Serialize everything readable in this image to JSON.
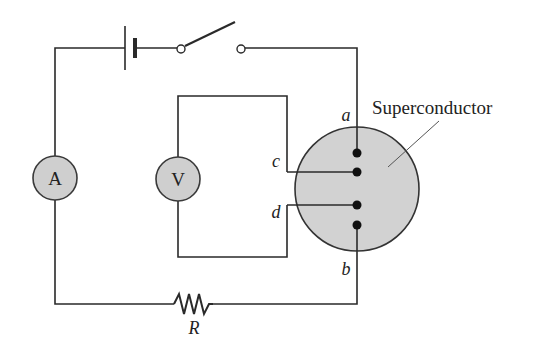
{
  "diagram": {
    "type": "circuit",
    "components": {
      "ammeter": {
        "symbol": "A"
      },
      "voltmeter": {
        "symbol": "V"
      },
      "resistor": {
        "label": "R"
      },
      "battery": {
        "label": ""
      },
      "switch": {
        "state": "open"
      },
      "sample": {
        "label": "Superconductor"
      }
    },
    "contact_labels": {
      "a": "a",
      "b": "b",
      "c": "c",
      "d": "d"
    },
    "colors": {
      "wire": "#2a2a2a",
      "meter_fill": "#cfcfcf",
      "superconductor_fill": "#d2d2d2",
      "contact_dot": "#111111",
      "background": "#ffffff"
    }
  }
}
